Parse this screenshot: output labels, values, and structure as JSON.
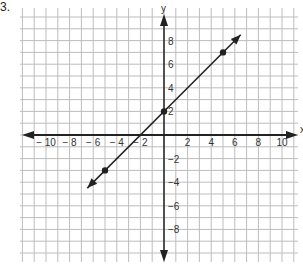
{
  "problem_number": "3.",
  "graph": {
    "x_axis_label": "x",
    "y_axis_label": "y",
    "x_tick_labels": [
      "-10",
      "-8",
      "-6",
      "-4",
      "-2",
      "2",
      "4",
      "6",
      "8",
      "10"
    ],
    "y_tick_labels": [
      "8",
      "6",
      "4",
      "2",
      "-2",
      "-4",
      "-6",
      "-8"
    ],
    "colors": {
      "grid": "#bdbdbd",
      "axis": "#222222",
      "line": "#222222"
    }
  },
  "chart_data": {
    "type": "line",
    "title": "",
    "xlabel": "x",
    "ylabel": "y",
    "xlim": [
      -11,
      11
    ],
    "ylim": [
      -11,
      10
    ],
    "grid": true,
    "series": [
      {
        "name": "line",
        "equation": "y = x + 2",
        "points": [
          {
            "x": -5,
            "y": -3
          },
          {
            "x": 0,
            "y": 2
          },
          {
            "x": 5,
            "y": 7
          }
        ],
        "extends_from": {
          "x": -6.5,
          "y": -4.5
        },
        "extends_to": {
          "x": 6.5,
          "y": 8.5
        }
      }
    ]
  }
}
